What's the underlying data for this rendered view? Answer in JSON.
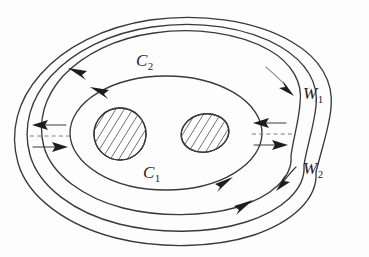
{
  "figure": {
    "kind": "mathematical-diagram",
    "background_color": "#fdfdfd",
    "stroke_color": "#3a3a3c",
    "arrow_color": "#1d1d1f",
    "hatch_color": "#56565a",
    "dashed_cut_color": "#7d7d82"
  },
  "labels": {
    "curve_inner": {
      "symbol": "C",
      "subscript": "2"
    },
    "curve_outer": {
      "symbol": "C",
      "subscript": "1"
    },
    "band_upper": {
      "symbol": "W",
      "subscript": "1"
    },
    "band_lower": {
      "symbol": "W",
      "subscript": "2"
    }
  },
  "holes": [
    {
      "name": "left-hole",
      "shape": "circle",
      "hatched": true
    },
    {
      "name": "right-hole",
      "shape": "oval",
      "hatched": true
    }
  ],
  "orientation_arrows": [
    {
      "name": "outer-top-left",
      "direction": "leftward"
    },
    {
      "name": "inner-top-left",
      "direction": "leftward"
    },
    {
      "name": "inner-bottom-right",
      "direction": "rightward"
    },
    {
      "name": "outer-bottom-right",
      "direction": "rightward"
    }
  ],
  "cut_arrows": [
    {
      "name": "left-cut-upper",
      "direction": "leftward"
    },
    {
      "name": "left-cut-lower",
      "direction": "rightward"
    },
    {
      "name": "right-cut-upper",
      "direction": "leftward"
    },
    {
      "name": "right-cut-lower",
      "direction": "rightward"
    }
  ],
  "leader_arrows": [
    {
      "name": "w1-leader",
      "direction": "down-right"
    },
    {
      "name": "w2-leader",
      "direction": "down-left"
    }
  ]
}
